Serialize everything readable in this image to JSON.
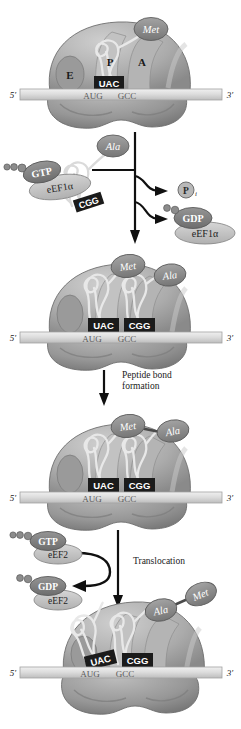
{
  "figure": {
    "background_color": "#ffffff",
    "mrna": {
      "five_prime": "5′",
      "three_prime": "3′",
      "codon_1": "AUG",
      "codon_2": "GCC"
    },
    "colors": {
      "ribosome_large": "#a9a9a9",
      "ribosome_large_dark": "#8d8d8d",
      "ribosome_small": "#939393",
      "ribosome_highlight": "#c9c9c9",
      "trna": "#d8d8d8",
      "amino_acid": "#8f8f8f",
      "anticodon_box": "#1b1b1b",
      "anticodon_text": "#ffffff",
      "mrna_strand": "#dcdcdc",
      "factor_light": "#c4c4c4",
      "factor_dark": "#7e7e7e",
      "arrow": "#101010",
      "text": "#1a1a1a"
    }
  },
  "panels": [
    {
      "id": "panel-initiation",
      "name": "ribosome-with-met-trna",
      "sites": {
        "e": "E",
        "p": "P",
        "a": "A"
      },
      "trnas": [
        {
          "anticodon": "UAC",
          "amino_acid": "Met",
          "site": "P"
        }
      ],
      "mrna": {
        "five_prime": "5′",
        "three_prime": "3′",
        "codon_1": "AUG",
        "codon_2": "GCC"
      }
    },
    {
      "id": "panel-aminoacyl-delivery",
      "name": "eef1a-ternary-complex",
      "incoming": {
        "amino_acid": "Ala",
        "anticodon": "CGG",
        "nucleotide": "GTP",
        "factor": "eEF1α"
      },
      "released": [
        {
          "label": "P",
          "subscript": "i",
          "name": "inorganic-phosphate"
        },
        {
          "nucleotide": "GDP",
          "factor": "eEF1α",
          "name": "gdp-eef1a"
        }
      ]
    },
    {
      "id": "panel-both-trnas",
      "name": "ribosome-with-two-trnas",
      "trnas": [
        {
          "anticodon": "UAC",
          "amino_acid": "Met",
          "site": "P"
        },
        {
          "anticodon": "CGG",
          "amino_acid": "Ala",
          "site": "A"
        }
      ],
      "mrna": {
        "five_prime": "5′",
        "three_prime": "3′",
        "codon_1": "AUG",
        "codon_2": "GCC"
      }
    },
    {
      "id": "panel-peptide-bond",
      "name": "peptide-bond-formation-step",
      "step_label": "Peptide bond\nformation"
    },
    {
      "id": "panel-dipeptide",
      "name": "ribosome-with-dipeptide",
      "trnas": [
        {
          "anticodon": "UAC",
          "amino_acid": "",
          "site": "P"
        },
        {
          "anticodon": "CGG",
          "amino_acid": "Met-Ala",
          "site": "A"
        }
      ],
      "dipeptide": [
        "Met",
        "Ala"
      ],
      "mrna": {
        "five_prime": "5′",
        "three_prime": "3′",
        "codon_1": "AUG",
        "codon_2": "GCC"
      }
    },
    {
      "id": "panel-translocation",
      "name": "eef2-translocation-step",
      "step_label": "Translocation",
      "bound": {
        "nucleotide": "GTP",
        "factor": "eEF2"
      },
      "released": {
        "nucleotide": "GDP",
        "factor": "eEF2"
      }
    },
    {
      "id": "panel-translocated",
      "name": "ribosome-after-translocation",
      "trnas": [
        {
          "anticodon": "UAC",
          "site": "E",
          "state": "exiting"
        },
        {
          "anticodon": "CGG",
          "amino_acid": "Ala-Met",
          "site": "P"
        }
      ],
      "dipeptide": [
        "Ala",
        "Met"
      ],
      "mrna": {
        "five_prime": "5′",
        "three_prime": "3′",
        "codon_1": "AUG",
        "codon_2": "GCC"
      }
    }
  ]
}
